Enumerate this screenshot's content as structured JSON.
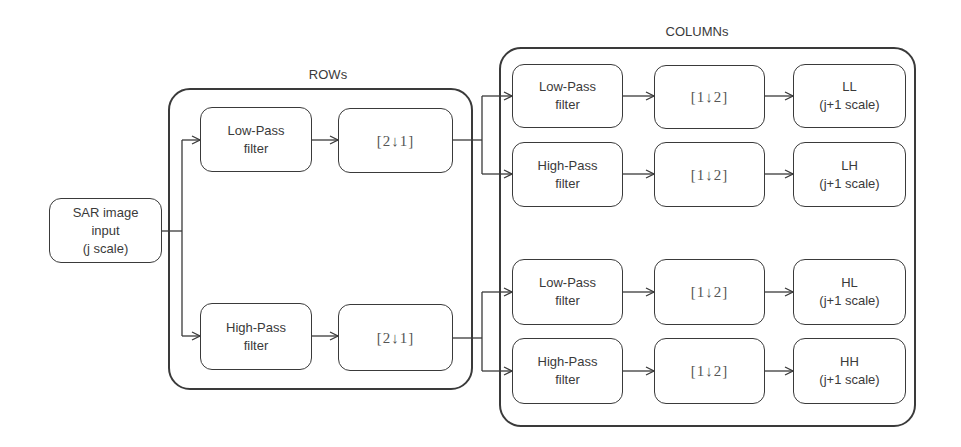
{
  "diagram": {
    "type": "flow",
    "input": {
      "lines": [
        "SAR image",
        "input",
        "(j scale)"
      ]
    },
    "rows_group": {
      "label": "ROWs",
      "branches": [
        {
          "filter": [
            "Low-Pass",
            "filter"
          ],
          "downsample": "[2↓1]"
        },
        {
          "filter": [
            "High-Pass",
            "filter"
          ],
          "downsample": "[2↓1]"
        }
      ]
    },
    "columns_group": {
      "label": "COLUMNs",
      "branches": [
        {
          "filter": [
            "Low-Pass",
            "filter"
          ],
          "downsample": "[1↓2]",
          "output": [
            "LL",
            "(j+1 scale)"
          ]
        },
        {
          "filter": [
            "High-Pass",
            "filter"
          ],
          "downsample": "[1↓2]",
          "output": [
            "LH",
            "(j+1 scale)"
          ]
        },
        {
          "filter": [
            "Low-Pass",
            "filter"
          ],
          "downsample": "[1↓2]",
          "output": [
            "HL",
            "(j+1 scale)"
          ]
        },
        {
          "filter": [
            "High-Pass",
            "filter"
          ],
          "downsample": "[1↓2]",
          "output": [
            "HH",
            "(j+1 scale)"
          ]
        }
      ]
    },
    "edges": [
      [
        "input",
        "rows.lp"
      ],
      [
        "input",
        "rows.hp"
      ],
      [
        "rows.lp",
        "rows.down1"
      ],
      [
        "rows.hp",
        "rows.down2"
      ],
      [
        "rows.down1",
        "cols.lp1"
      ],
      [
        "rows.down1",
        "cols.hp1"
      ],
      [
        "rows.down2",
        "cols.lp2"
      ],
      [
        "rows.down2",
        "cols.hp2"
      ],
      [
        "cols.lp1",
        "cols.down1"
      ],
      [
        "cols.down1",
        "LL"
      ],
      [
        "cols.hp1",
        "cols.down2"
      ],
      [
        "cols.down2",
        "LH"
      ],
      [
        "cols.lp2",
        "cols.down3"
      ],
      [
        "cols.down3",
        "HL"
      ],
      [
        "cols.hp2",
        "cols.down4"
      ],
      [
        "cols.down4",
        "HH"
      ]
    ]
  }
}
